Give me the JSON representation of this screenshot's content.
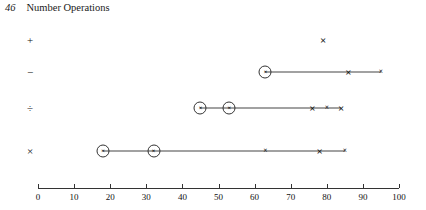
{
  "page": {
    "number": "46",
    "title": "Number Operations"
  },
  "chart_data": {
    "type": "scatter",
    "title": "Number Operations",
    "xlabel": "",
    "ylabel": "",
    "xlim": [
      0,
      100
    ],
    "ylim": [
      0,
      4
    ],
    "grid": false,
    "legend": null,
    "axis": {
      "ticks": [
        0,
        10,
        20,
        30,
        40,
        50,
        60,
        70,
        80,
        90,
        100
      ],
      "tick_labels": [
        "0",
        "10",
        "20",
        "30",
        "40",
        "50",
        "60",
        "70",
        "80",
        "90",
        "100"
      ]
    },
    "categories": [
      "+",
      "−",
      "÷",
      "×"
    ],
    "series": [
      {
        "name": "+",
        "label": "+",
        "row": 0,
        "range": null,
        "points": [
          {
            "x": 79,
            "style": "big-x"
          }
        ]
      },
      {
        "name": "minus",
        "label": "−",
        "row": 1,
        "range": [
          63,
          95
        ],
        "points": [
          {
            "x": 63,
            "style": "circled-x"
          },
          {
            "x": 86,
            "style": "big-x"
          },
          {
            "x": 95,
            "style": "small-x"
          }
        ]
      },
      {
        "name": "divide",
        "label": "÷",
        "row": 2,
        "range": [
          45,
          84
        ],
        "points": [
          {
            "x": 45,
            "style": "circled-x"
          },
          {
            "x": 53,
            "style": "circled-x"
          },
          {
            "x": 76,
            "style": "big-x"
          },
          {
            "x": 80,
            "style": "small-x"
          },
          {
            "x": 84,
            "style": "big-x"
          }
        ]
      },
      {
        "name": "multiply",
        "label": "×",
        "row": 3,
        "range": [
          18,
          85
        ],
        "points": [
          {
            "x": 18,
            "style": "circled-x"
          },
          {
            "x": 32,
            "style": "circled-x"
          },
          {
            "x": 63,
            "style": "small-x"
          },
          {
            "x": 78,
            "style": "big-x"
          },
          {
            "x": 85,
            "style": "small-x"
          }
        ]
      }
    ],
    "marker_glyphs": {
      "big-x": "×",
      "small-x": "×",
      "circled-x": "×"
    }
  },
  "colors": {
    "ink": "#111111",
    "line": "#444444",
    "axis": "#333333",
    "background": "#ffffff"
  }
}
